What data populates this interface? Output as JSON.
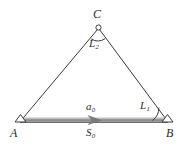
{
  "figure": {
    "name": "triangulation-diagram",
    "background_color": "#ffffff",
    "line_color": "#3a3a3a",
    "baseline_color": "#8c8c8c",
    "baseline_highlight_color": "#bdbdbd",
    "baseline_shadow_color": "#6e6e6e"
  },
  "vertices": [
    {
      "id": "C",
      "label": "C",
      "marker": "circle-station-marker",
      "x": 98,
      "y": 28
    },
    {
      "id": "A",
      "label": "A",
      "marker": "triangle-station-marker",
      "x": 20,
      "y": 121
    },
    {
      "id": "B",
      "label": "B",
      "marker": "triangle-station-marker",
      "x": 168,
      "y": 121
    }
  ],
  "angles": [
    {
      "id": "L1",
      "letter": "L",
      "subscript": "1",
      "at_vertex": "B"
    },
    {
      "id": "L2",
      "letter": "L",
      "subscript": "2",
      "at_vertex": "C"
    }
  ],
  "baseline": {
    "from": "A",
    "to": "B",
    "arrow_direction": "right",
    "label_above": {
      "letter": "a",
      "subscript": "0"
    },
    "label_below": {
      "letter": "S",
      "subscript": "0"
    }
  },
  "labels": {
    "C": "C",
    "A": "A",
    "B": "B",
    "L_letter": "L",
    "L1_sub": "1",
    "L2_sub": "2",
    "a_letter": "a",
    "a0_sub": "0",
    "S_letter": "S",
    "S0_sub": "0"
  }
}
